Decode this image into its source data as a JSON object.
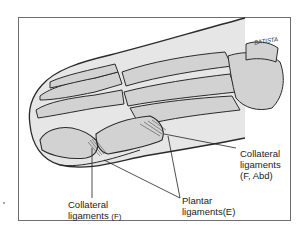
{
  "figure": {
    "signature": "BATISTA",
    "colors": {
      "frame": "#6e6e6e",
      "skin_fill": "#e6e6e6",
      "bone_fill": "#d2d2d2",
      "outline": "#2a2a2a"
    }
  },
  "labels": {
    "collateral_right": {
      "line1": "Collateral",
      "line2": "ligaments",
      "line3": "(F, Abd)"
    },
    "collateral_bottom": {
      "line1": "Collateral",
      "line2": "ligaments",
      "line2_suffix": "(F)"
    },
    "plantar": {
      "line1": "Plantar",
      "line2": "ligaments(E)"
    }
  }
}
